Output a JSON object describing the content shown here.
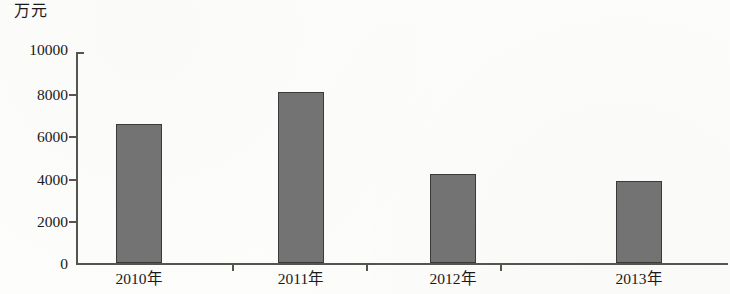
{
  "chart_data": {
    "type": "bar",
    "title": "",
    "subtitle": "",
    "unit_label": "万元",
    "xlabel": "",
    "ylabel": "",
    "categories": [
      "2010年",
      "2011年",
      "2012年",
      "2013年"
    ],
    "values": [
      6600,
      8100,
      4200,
      3900
    ],
    "ylim": [
      0,
      10000
    ],
    "ytick_values": [
      0,
      2000,
      4000,
      6000,
      8000,
      10000
    ],
    "ytick_labels": [
      "0",
      "2000",
      "4000",
      "6000",
      "8000",
      "10000"
    ],
    "grid": false,
    "legend": null,
    "series": [
      {
        "name": "",
        "values": [
          6600,
          8100,
          4200,
          3900
        ],
        "color": "#737373",
        "edge_color": "#3a3a3a"
      }
    ],
    "annotations": []
  },
  "colors": {
    "bar_fill": "#737373",
    "bar_edge": "#3a3a3a",
    "axis": "#55544f",
    "text": "#1a1a1a",
    "background": "#fdfdfc"
  }
}
